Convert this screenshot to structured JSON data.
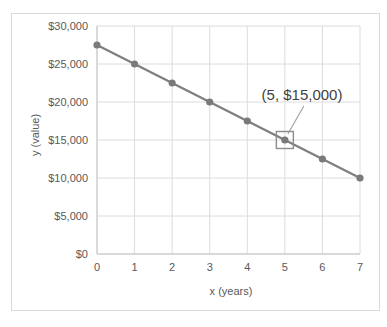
{
  "canvas": {
    "width": 387,
    "height": 327,
    "background": "#ffffff"
  },
  "chart_data": {
    "type": "line",
    "x": [
      0,
      1,
      2,
      3,
      4,
      5,
      6,
      7
    ],
    "series": [
      {
        "name": "value",
        "values": [
          27500,
          25000,
          22500,
          20000,
          17500,
          15000,
          12500,
          10000
        ],
        "color": "#7f7f7f"
      }
    ],
    "title": "",
    "xlabel": "x (years)",
    "ylabel": "y (value)",
    "xlim": [
      0,
      7
    ],
    "ylim": [
      0,
      30000
    ],
    "grid": true,
    "x_ticks": {
      "values": [
        0,
        1,
        2,
        3,
        4,
        5,
        6,
        7
      ],
      "labels": [
        "0",
        "1",
        "2",
        "3",
        "4",
        "5",
        "6",
        "7"
      ]
    },
    "y_ticks": {
      "values": [
        0,
        5000,
        10000,
        15000,
        20000,
        25000,
        30000
      ],
      "labels": [
        "$0",
        "$5,000",
        "$10,000",
        "$15,000",
        "$20,000",
        "$25,000",
        "$30,000"
      ]
    },
    "annotation": {
      "label": "(5, $15,000)",
      "point_x": 5,
      "point_y": 15000,
      "highlight": "square-box-around-point",
      "leader_line": true
    },
    "colors": {
      "series_line": "#7f7f7f",
      "marker": "#7a7a7a",
      "gridline": "#dcdcdc",
      "axis_line": "#c6c6c6",
      "tick_label": "#595959",
      "axis_title": "#595959",
      "annotation_text": "#3f3f3f",
      "leader_line": "#a8a39c",
      "highlight_box": "#8c8c8c",
      "chart_border": "#d9d9d9"
    }
  }
}
